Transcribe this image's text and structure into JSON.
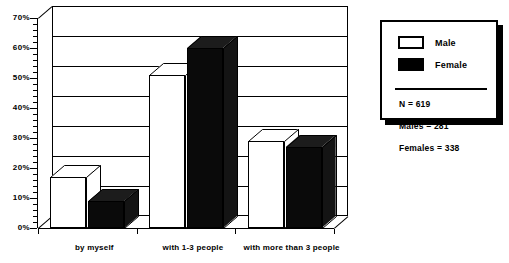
{
  "chart_data": {
    "type": "bar",
    "title": "",
    "xlabel": "",
    "ylabel": "",
    "categories": [
      "by myself",
      "with 1-3 people",
      "with more than 3 people"
    ],
    "series": [
      {
        "name": "Male",
        "color": "#ffffff",
        "values": [
          17,
          51,
          29
        ]
      },
      {
        "name": "Female",
        "color": "#000000",
        "values": [
          9,
          60,
          27
        ]
      }
    ],
    "ylim": [
      0,
      70
    ],
    "ytick_labels": [
      "0%",
      "10%",
      "20%",
      "30%",
      "40%",
      "50%",
      "60%",
      "70%"
    ],
    "ytick_values": [
      0,
      10,
      20,
      30,
      40,
      50,
      60,
      70
    ],
    "minor_tick_interval": 2,
    "grid": true,
    "legend_position": "right",
    "three_d": true
  },
  "legend": {
    "entries": [
      {
        "label": "Male",
        "swatch": "empty"
      },
      {
        "label": "Female",
        "swatch": "filled"
      }
    ],
    "stats": [
      "N = 619",
      "Males = 281",
      "Females = 338"
    ]
  }
}
